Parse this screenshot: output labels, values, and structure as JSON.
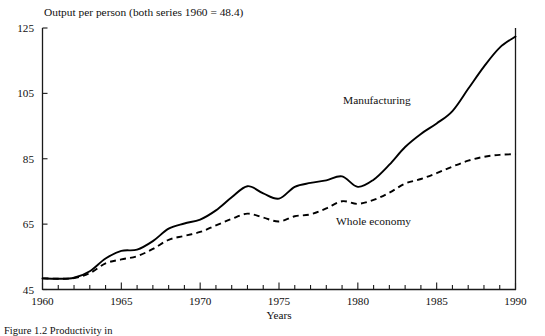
{
  "figure": {
    "title": "Output per person (both series 1960 = 48.4)",
    "caption": "Figure 1.2 Productivity in"
  },
  "chart_data": {
    "type": "line",
    "title": "Output per person (both series 1960 = 48.4)",
    "xlabel": "Years",
    "ylabel": "",
    "xlim": [
      1960,
      1990
    ],
    "ylim": [
      45,
      125
    ],
    "grid": false,
    "legend_position": "inline-annotation",
    "yticks": [
      45,
      65,
      85,
      105,
      125
    ],
    "xticks": [
      1960,
      1965,
      1970,
      1975,
      1980,
      1985,
      1990
    ],
    "xtick_labels": [
      "1960",
      "1965",
      "1970",
      "1975",
      "1980",
      "1985",
      "1990"
    ],
    "ytick_labels": [
      "45",
      "65",
      "85",
      "105",
      "125"
    ],
    "minor_xticks_every": 1,
    "x": [
      1960,
      1961,
      1962,
      1963,
      1964,
      1965,
      1966,
      1967,
      1968,
      1969,
      1970,
      1971,
      1972,
      1973,
      1974,
      1975,
      1976,
      1977,
      1978,
      1979,
      1980,
      1981,
      1982,
      1983,
      1984,
      1985,
      1986,
      1987,
      1988,
      1989,
      1990
    ],
    "series": [
      {
        "name": "Manufacturing",
        "style": "solid",
        "values": [
          48.4,
          48.3,
          48.6,
          50.6,
          54.5,
          56.8,
          57.2,
          59.8,
          63.6,
          65.2,
          66.4,
          69.2,
          73.2,
          76.6,
          74.4,
          72.8,
          76.4,
          77.6,
          78.4,
          79.6,
          76.4,
          78.6,
          83.2,
          88.6,
          92.6,
          95.8,
          99.6,
          106.4,
          113.2,
          119.0,
          122.4
        ]
      },
      {
        "name": "Whole economy",
        "style": "dashed",
        "values": [
          48.4,
          48.3,
          48.5,
          50.0,
          53.0,
          54.2,
          55.2,
          57.4,
          60.2,
          61.4,
          62.6,
          64.6,
          66.6,
          68.2,
          67.0,
          65.8,
          67.4,
          68.0,
          69.8,
          72.0,
          71.2,
          72.4,
          74.6,
          77.4,
          78.8,
          80.6,
          82.6,
          84.4,
          85.6,
          86.2,
          86.4
        ]
      }
    ],
    "annotations": [
      {
        "text": "Manufacturing",
        "x": 1982.2,
        "y": 101.5
      },
      {
        "text": "Whole economy",
        "x": 1978.6,
        "y": 64.0
      }
    ]
  },
  "axis_titles": {
    "x": "Years"
  }
}
